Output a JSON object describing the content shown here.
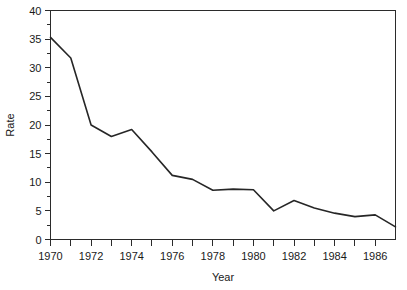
{
  "chart_data": {
    "type": "line",
    "title": "",
    "xlabel": "Year",
    "ylabel": "Rate",
    "xlim": [
      1970,
      1987
    ],
    "ylim": [
      0,
      40
    ],
    "grid": false,
    "legend": null,
    "line_color": "#262626",
    "axis_color": "#2b2b2b",
    "background_color": "#ffffff",
    "x": [
      1970,
      1971,
      1972,
      1973,
      1974,
      1975,
      1976,
      1977,
      1978,
      1979,
      1980,
      1981,
      1982,
      1983,
      1984,
      1985,
      1986,
      1987
    ],
    "values": [
      35.3,
      31.7,
      20.0,
      18.0,
      19.2,
      15.3,
      11.2,
      10.5,
      8.6,
      8.8,
      8.7,
      5.0,
      6.8,
      5.5,
      4.6,
      4.0,
      4.3,
      2.2
    ],
    "series": [
      {
        "name": "Rate",
        "values": [
          35.3,
          31.7,
          20.0,
          18.0,
          19.2,
          15.3,
          11.2,
          10.5,
          8.6,
          8.8,
          8.7,
          5.0,
          6.8,
          5.5,
          4.6,
          4.0,
          4.3,
          2.2
        ]
      }
    ],
    "yticks": [
      0,
      5,
      10,
      15,
      20,
      25,
      30,
      35,
      40
    ],
    "ytick_labels": [
      "0",
      "5",
      "10",
      "15",
      "20",
      "25",
      "30",
      "35",
      "40"
    ],
    "y_minor_ticks": [
      2.5,
      7.5,
      12.5,
      17.5,
      22.5,
      27.5,
      32.5,
      37.5
    ],
    "xticks": [
      1970,
      1971,
      1972,
      1973,
      1974,
      1975,
      1976,
      1977,
      1978,
      1979,
      1980,
      1981,
      1982,
      1983,
      1984,
      1985,
      1986
    ],
    "xtick_labels": [
      "1970",
      "",
      "1972",
      "",
      "1974",
      "",
      "1976",
      "",
      "1978",
      "",
      "1980",
      "",
      "1982",
      "",
      "1984",
      "",
      "1986"
    ]
  }
}
